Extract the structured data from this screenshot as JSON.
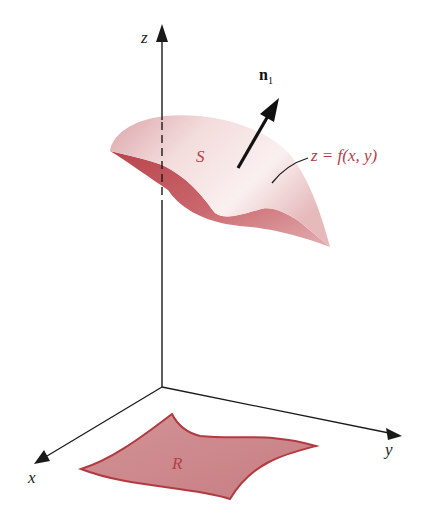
{
  "figure": {
    "type": "3d-surface-diagram",
    "axes": {
      "z_label": "z",
      "y_label": "y",
      "x_label": "x"
    },
    "surface": {
      "label": "S",
      "equation_label": "z = f(x, y)"
    },
    "normal_vector": {
      "label": "n",
      "subscript": "1"
    },
    "region": {
      "label": "R"
    },
    "colors": {
      "axis": "#1a1a1a",
      "surface_light": "#f3dcdc",
      "surface_mid": "#d98a8f",
      "surface_dark": "#b8454c",
      "region_fill": "#cf8a8e",
      "region_stroke": "#b23a40",
      "label_red": "#b5404a"
    }
  }
}
